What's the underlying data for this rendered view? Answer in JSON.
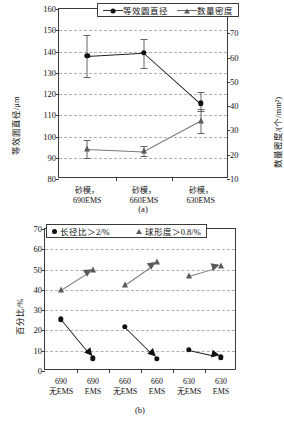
{
  "figure": {
    "panel_a_caption": "(a)",
    "panel_b_caption": "(b)"
  },
  "chart_data": [
    {
      "type": "line",
      "id": "a",
      "title": "",
      "xlabel": "",
      "ylabel": "等效圆直径/μm",
      "y2label": "数量密度/(个/mm²)",
      "grid": true,
      "legend_position": "top-center",
      "categories": [
        "砂模，\n690EMS",
        "砂模，\n660EMS",
        "砂模，\n630EMS"
      ],
      "category_lines": [
        [
          "砂模，",
          "690EMS"
        ],
        [
          "砂模，",
          "660EMS"
        ],
        [
          "砂模，",
          "630EMS"
        ]
      ],
      "ylim": [
        80,
        160
      ],
      "yticks": [
        80,
        90,
        100,
        110,
        120,
        130,
        140,
        150,
        160
      ],
      "y2lim": [
        10,
        80
      ],
      "y2ticks": [
        10,
        20,
        30,
        40,
        50,
        60,
        70,
        80
      ],
      "series": [
        {
          "name": "等效圆直径",
          "axis": "left",
          "marker": "circle",
          "color": "#111111",
          "values": [
            138.0,
            139.5,
            115.7
          ],
          "err_low": [
            128.0,
            132.2,
            112.0
          ],
          "err_high": [
            148.0,
            146.0,
            121.0
          ]
        },
        {
          "name": "数量密度",
          "axis": "right",
          "marker": "triangle",
          "color": "#5a5a5a",
          "values": [
            22.5,
            21.5,
            34.0
          ],
          "err_low": [
            18.5,
            19.5,
            29.0
          ],
          "err_high": [
            26.0,
            23.5,
            39.0
          ]
        }
      ]
    },
    {
      "type": "scatter",
      "id": "b",
      "title": "",
      "xlabel": "",
      "ylabel": "百分比/%",
      "grid": true,
      "legend_position": "top-center",
      "categories": [
        "690\n无EMS",
        "690\nEMS",
        "660\n无EMS",
        "660\nEMS",
        "630\n无EMS",
        "630\nEMS"
      ],
      "category_lines": [
        [
          "690",
          "无EMS"
        ],
        [
          "690",
          "EMS"
        ],
        [
          "660",
          "无EMS"
        ],
        [
          "660",
          "EMS"
        ],
        [
          "630",
          "无EMS"
        ],
        [
          "630",
          "EMS"
        ]
      ],
      "ylim": [
        0,
        70
      ],
      "yticks": [
        0,
        10,
        20,
        30,
        40,
        50,
        60,
        70
      ],
      "series": [
        {
          "name": "长径比＞2/%",
          "marker": "circle",
          "color": "#111111",
          "values": [
            25.5,
            6.3,
            21.7,
            6.1,
            10.3,
            6.8
          ],
          "arrows": [
            [
              0,
              1
            ],
            [
              2,
              3
            ],
            [
              4,
              5
            ]
          ]
        },
        {
          "name": "球形度＞0.8/%",
          "marker": "triangle",
          "color": "#5a5a5a",
          "values": [
            39.8,
            49.8,
            42.5,
            53.5,
            47.0,
            51.7
          ],
          "arrows": [
            [
              0,
              1
            ],
            [
              2,
              3
            ],
            [
              4,
              5
            ]
          ]
        }
      ]
    }
  ]
}
